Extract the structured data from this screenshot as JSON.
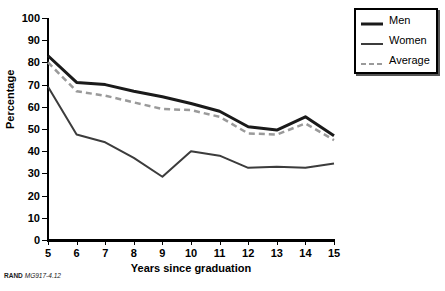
{
  "footer": {
    "org": "RAND",
    "figure_code": "MG917-4.12"
  },
  "legend": {
    "position": "top-right",
    "items": [
      {
        "label": "Men",
        "color": "#1a1a1a",
        "style": "solid",
        "width": 3
      },
      {
        "label": "Women",
        "color": "#3c3c3c",
        "style": "solid",
        "width": 2
      },
      {
        "label": "Average",
        "color": "#9a9a9a",
        "style": "dashed",
        "width": 2
      }
    ]
  },
  "chart_data": {
    "type": "line",
    "title": "",
    "xlabel": "Years since graduation",
    "ylabel": "Percentage",
    "x": [
      5,
      6,
      7,
      8,
      9,
      10,
      11,
      12,
      13,
      14,
      15
    ],
    "xtick_labels": [
      "5",
      "6",
      "7",
      "8",
      "9",
      "10",
      "11",
      "12",
      "13",
      "14",
      "15"
    ],
    "ytick_labels": [
      "0",
      "10",
      "20",
      "30",
      "40",
      "50",
      "60",
      "70",
      "80",
      "90",
      "100"
    ],
    "xlim": [
      5,
      15
    ],
    "ylim": [
      0,
      100
    ],
    "ytick_step": 10,
    "grid": false,
    "series": [
      {
        "name": "Men",
        "color": "#1a1a1a",
        "style": "solid",
        "width": 3,
        "values": [
          83,
          71,
          70,
          67,
          64.5,
          61.5,
          58,
          51,
          49.5,
          55.5,
          47
        ]
      },
      {
        "name": "Women",
        "color": "#3c3c3c",
        "style": "solid",
        "width": 2,
        "values": [
          69,
          47.5,
          44,
          37,
          28.5,
          40,
          38,
          32.5,
          33,
          32.5,
          34.5
        ]
      },
      {
        "name": "Average",
        "color": "#9a9a9a",
        "style": "dashed",
        "width": 2.5,
        "values": [
          80,
          67,
          65,
          62,
          59,
          58.5,
          55.5,
          48,
          47.5,
          52.5,
          45
        ]
      }
    ]
  }
}
